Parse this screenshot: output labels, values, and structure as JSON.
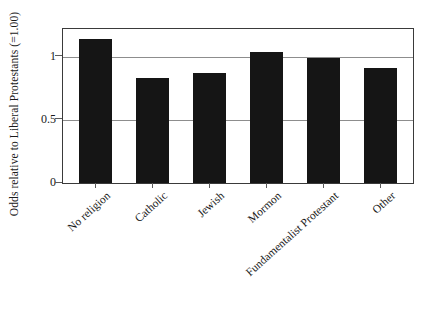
{
  "chart_data": {
    "type": "bar",
    "title": "",
    "xlabel": "",
    "ylabel": "Odds relative to Liberal Protestants (=1.00)",
    "categories": [
      "No religion",
      "Catholic",
      "Jewish",
      "Mormon",
      "Fundamentalist Protestant",
      "Other"
    ],
    "values": [
      1.14,
      0.83,
      0.87,
      1.04,
      0.99,
      0.91
    ],
    "ylim": [
      0,
      1.22
    ],
    "yticks": [
      0,
      0.5,
      1
    ],
    "ytick_labels": [
      "0",
      "0.5",
      "1"
    ],
    "grid": true,
    "legend": false,
    "bar_color": "#151515",
    "axis_color": "#3a3a3a",
    "grid_color": "#8d8d8d",
    "background": "#ffffff"
  }
}
